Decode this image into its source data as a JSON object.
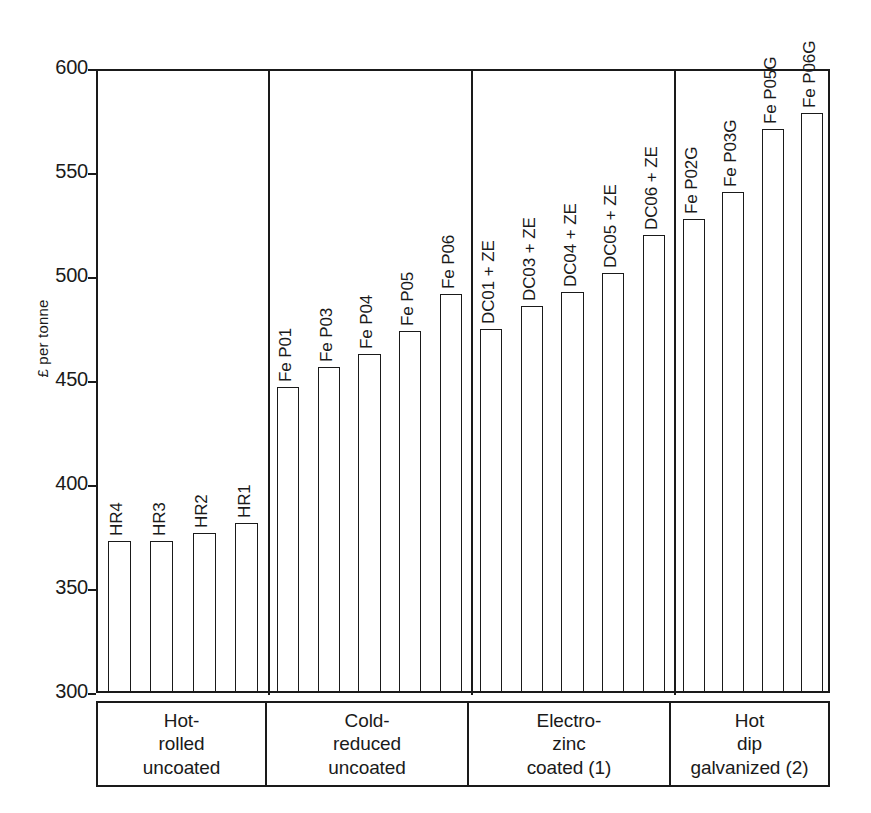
{
  "chart_data": {
    "type": "bar",
    "title": "",
    "xlabel": "",
    "ylabel": "£ per tonne",
    "ylim": [
      300,
      600
    ],
    "ytick_step": 50,
    "yticks": [
      300,
      350,
      400,
      450,
      500,
      550,
      600
    ],
    "grid": false,
    "legend": "none",
    "bar_style": {
      "fill": "#ffffff",
      "edge": "#1a1a1a",
      "label_rotation": 90
    },
    "categories": [
      "HR4",
      "HR3",
      "HR2",
      "HR1",
      "Fe P01",
      "Fe P03",
      "Fe P04",
      "Fe P05",
      "Fe P06",
      "DC01 + ZE",
      "DC03 + ZE",
      "DC04 + ZE",
      "DC05 + ZE",
      "DC06 + ZE",
      "Fe P02G",
      "Fe P03G",
      "Fe P05G",
      "Fe P06G"
    ],
    "values": [
      372,
      372,
      376,
      381,
      446,
      456,
      462,
      473,
      491,
      474,
      485,
      492,
      501,
      519,
      527,
      540,
      570,
      578
    ],
    "groups": [
      {
        "label_lines": [
          "Hot-",
          "rolled",
          "uncoated"
        ],
        "bars": [
          {
            "label": "HR4",
            "value": 372
          },
          {
            "label": "HR3",
            "value": 372
          },
          {
            "label": "HR2",
            "value": 376
          },
          {
            "label": "HR1",
            "value": 381
          }
        ]
      },
      {
        "label_lines": [
          "Cold-",
          "reduced",
          "uncoated"
        ],
        "bars": [
          {
            "label": "Fe P01",
            "value": 446
          },
          {
            "label": "Fe P03",
            "value": 456
          },
          {
            "label": "Fe P04",
            "value": 462
          },
          {
            "label": "Fe P05",
            "value": 473
          },
          {
            "label": "Fe P06",
            "value": 491
          }
        ]
      },
      {
        "label_lines": [
          "Electro-",
          "zinc",
          "coated (1)"
        ],
        "bars": [
          {
            "label": "DC01 + ZE",
            "value": 474
          },
          {
            "label": "DC03 + ZE",
            "value": 485
          },
          {
            "label": "DC04 + ZE",
            "value": 492
          },
          {
            "label": "DC05 + ZE",
            "value": 501
          },
          {
            "label": "DC06 + ZE",
            "value": 519
          }
        ]
      },
      {
        "label_lines": [
          "Hot",
          "dip",
          "galvanized (2)"
        ],
        "bars": [
          {
            "label": "Fe P02G",
            "value": 527
          },
          {
            "label": "Fe P03G",
            "value": 540
          },
          {
            "label": "Fe P05G",
            "value": 570
          },
          {
            "label": "Fe P06G",
            "value": 578
          }
        ]
      }
    ]
  }
}
